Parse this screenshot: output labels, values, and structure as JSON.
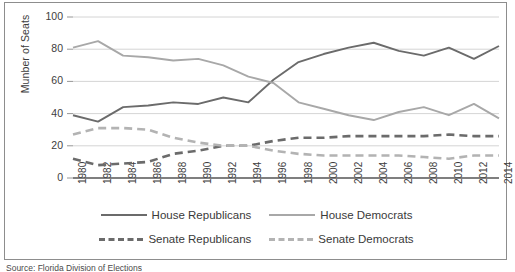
{
  "figure": {
    "source_note": "Source: Florida Division of Elections"
  },
  "chart_data": {
    "type": "line",
    "title": "",
    "xlabel": "",
    "ylabel": "Munber of Seats",
    "ylim": [
      0,
      100
    ],
    "ytick_values": [
      0,
      20,
      40,
      60,
      80,
      100
    ],
    "ytick_labels": [
      "0",
      "20",
      "40",
      "60",
      "80",
      "100"
    ],
    "grid": true,
    "grid_axis": "y",
    "legend_position": "bottom",
    "x": [
      1980,
      1982,
      1984,
      1986,
      1988,
      1990,
      1992,
      1994,
      1996,
      1998,
      2000,
      2002,
      2004,
      2006,
      2008,
      2010,
      2012,
      2014
    ],
    "categories": [
      "1980",
      "1982",
      "1984",
      "1986",
      "1988",
      "1990",
      "1992",
      "1994",
      "1996",
      "1998",
      "2000",
      "2002",
      "2004",
      "2006",
      "2008",
      "2010",
      "2012",
      "2014"
    ],
    "series": [
      {
        "name": "House Republicans",
        "style": "solid",
        "color": "#6b6b6b",
        "values": [
          39,
          35,
          44,
          45,
          47,
          46,
          50,
          47,
          61,
          72,
          77,
          81,
          84,
          79,
          76,
          81,
          74,
          82
        ]
      },
      {
        "name": "House Democrats",
        "style": "solid",
        "color": "#a8a8a8",
        "values": [
          81,
          85,
          76,
          75,
          73,
          74,
          70,
          63,
          59,
          47,
          43,
          39,
          36,
          41,
          44,
          39,
          46,
          37
        ]
      },
      {
        "name": "Senate Republicans",
        "style": "dashed",
        "color": "#6b6b6b",
        "values": [
          12,
          8,
          9,
          10,
          15,
          17,
          20,
          20,
          23,
          25,
          25,
          26,
          26,
          26,
          26,
          27,
          26,
          26
        ]
      },
      {
        "name": "Senate Democrats",
        "style": "dashed",
        "color": "#b3b3b3",
        "values": [
          27,
          31,
          31,
          30,
          25,
          22,
          20,
          20,
          17,
          15,
          14,
          14,
          14,
          14,
          13,
          12,
          14,
          14
        ]
      }
    ]
  },
  "legend": {
    "items": [
      {
        "label": "House Republicans",
        "color": "#6b6b6b",
        "style": "solid"
      },
      {
        "label": "House Democrats",
        "color": "#a8a8a8",
        "style": "solid"
      },
      {
        "label": "Senate Republicans",
        "color": "#6b6b6b",
        "style": "dashed"
      },
      {
        "label": "Senate Democrats",
        "color": "#b3b3b3",
        "style": "dashed"
      }
    ]
  }
}
